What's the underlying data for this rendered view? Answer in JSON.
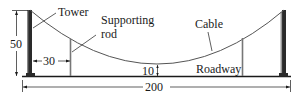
{
  "diagram": {
    "labels": {
      "tower": "Tower",
      "supporting_rod_line1": "Supporting",
      "supporting_rod_line2": "rod",
      "cable": "Cable",
      "roadway": "Roadway"
    },
    "dimensions": {
      "tower_height": "50",
      "rod_offset": "30",
      "min_clearance": "10",
      "span": "200"
    },
    "colors": {
      "ink": "#1a1a1a",
      "tower": "#2a2a2a",
      "rod": "#777777",
      "cable": "#555555"
    }
  }
}
